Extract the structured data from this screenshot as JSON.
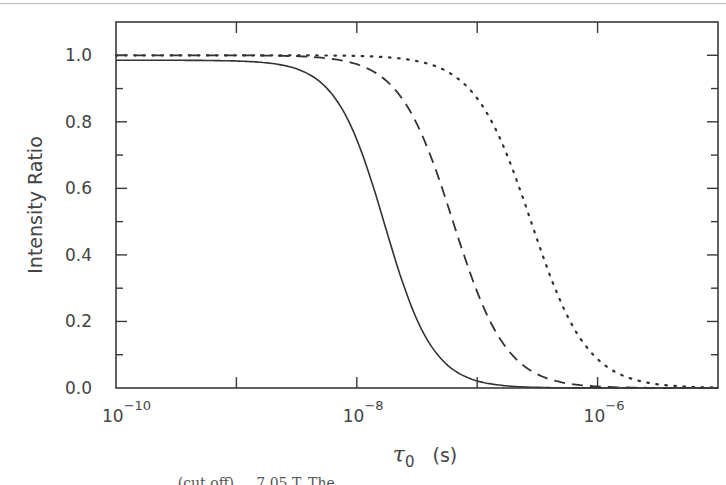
{
  "chart_data": {
    "type": "line",
    "title": "",
    "xlabel": "τ0 (s)",
    "xlabel_symbol": "τ",
    "xlabel_subscript": "0",
    "xlabel_unit": "(s)",
    "ylabel": "Intensity Ratio",
    "xscale": "log",
    "xlim": [
      1e-10,
      1e-05
    ],
    "ylim": [
      0.0,
      1.1
    ],
    "x_ticks_major": [
      1e-10,
      1e-09,
      1e-08,
      1e-07,
      1e-06,
      1e-05
    ],
    "x_tick_labels": [
      {
        "base": "10",
        "exp": "−10",
        "value": 1e-10
      },
      {
        "base": "10",
        "exp": "−8",
        "value": 1e-08
      },
      {
        "base": "10",
        "exp": "−6",
        "value": 1e-06
      }
    ],
    "y_ticks": [
      0.0,
      0.2,
      0.4,
      0.6,
      0.8,
      1.0
    ],
    "y_tick_labels": [
      "0.0",
      "0.2",
      "0.4",
      "0.6",
      "0.8",
      "1.0"
    ],
    "grid": false,
    "legend": null,
    "series": [
      {
        "name": "solid",
        "style": "solid",
        "plateau": 0.985,
        "half_point_tau": 1.7e-08,
        "x": [
          1e-10,
          1e-09,
          3e-09,
          5e-09,
          1e-08,
          1.7e-08,
          3e-08,
          5e-08,
          1e-07,
          2e-07,
          1e-06,
          1e-05
        ],
        "y": [
          0.985,
          0.98,
          0.93,
          0.85,
          0.7,
          0.49,
          0.25,
          0.12,
          0.04,
          0.01,
          0.0,
          0.0
        ]
      },
      {
        "name": "dashed",
        "style": "dashed",
        "plateau": 1.0,
        "half_point_tau": 6.3e-08,
        "x": [
          1e-10,
          1e-09,
          5e-09,
          1e-08,
          2e-08,
          4e-08,
          6.3e-08,
          1e-07,
          2e-07,
          5e-07,
          1e-06,
          1e-05
        ],
        "y": [
          1.0,
          1.0,
          0.99,
          0.95,
          0.86,
          0.67,
          0.5,
          0.32,
          0.13,
          0.03,
          0.01,
          0.0
        ]
      },
      {
        "name": "dotted",
        "style": "dotted",
        "plateau": 1.0,
        "half_point_tau": 2.8e-07,
        "x": [
          1e-10,
          1e-09,
          1e-08,
          3e-08,
          6e-08,
          1e-07,
          2e-07,
          2.8e-07,
          5e-07,
          1e-06,
          3e-06,
          1e-05
        ],
        "y": [
          1.0,
          1.0,
          1.0,
          0.98,
          0.94,
          0.86,
          0.62,
          0.5,
          0.23,
          0.07,
          0.02,
          0.01
        ]
      }
    ]
  },
  "caption": {
    "visible_text": "... (cut off) ... 7.05 T. The"
  }
}
